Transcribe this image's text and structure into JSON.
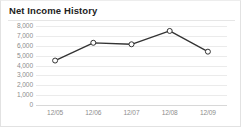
{
  "chart_data": {
    "type": "line",
    "title": "Net Income History",
    "xlabel": "",
    "ylabel": "",
    "categories": [
      "12/05",
      "12/06",
      "12/07",
      "12/08",
      "12/09"
    ],
    "series": [
      {
        "name": "Net Income",
        "values": [
          4500,
          6300,
          6150,
          7500,
          5400
        ]
      }
    ],
    "ylim": [
      0,
      8000
    ],
    "yticks": [
      0,
      1000,
      2000,
      3000,
      4000,
      5000,
      6000,
      7000,
      8000
    ],
    "ytick_labels": [
      "0",
      "1,000",
      "2,000",
      "3,000",
      "4,000",
      "5,000",
      "6,000",
      "7,000",
      "8,000"
    ],
    "grid": true,
    "legend": false,
    "marker": "open-circle",
    "colors": {
      "line": "#333333",
      "marker_fill": "#ffffff",
      "marker_stroke": "#333333",
      "grid": "#ebebeb",
      "axis": "#d8d8d8",
      "tick_text": "#8d8d8d",
      "title_text": "#222222",
      "background": "#ffffff",
      "border": "#e2e2e2"
    }
  }
}
